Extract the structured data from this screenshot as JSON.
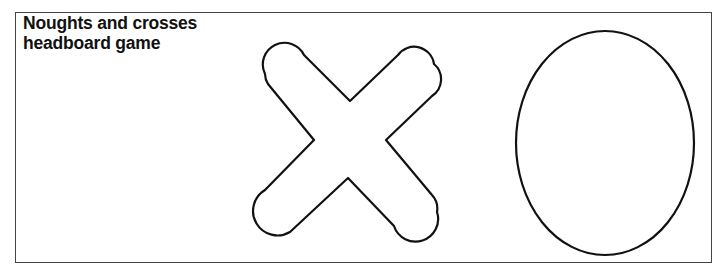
{
  "title": {
    "line1": "Noughts and crosses",
    "line2": "headboard game"
  },
  "shapes": [
    {
      "name": "cross",
      "type": "rounded-x"
    },
    {
      "name": "nought",
      "type": "ellipse"
    }
  ],
  "colors": {
    "stroke": "#111111",
    "frame": "#444444",
    "background": "#ffffff"
  }
}
